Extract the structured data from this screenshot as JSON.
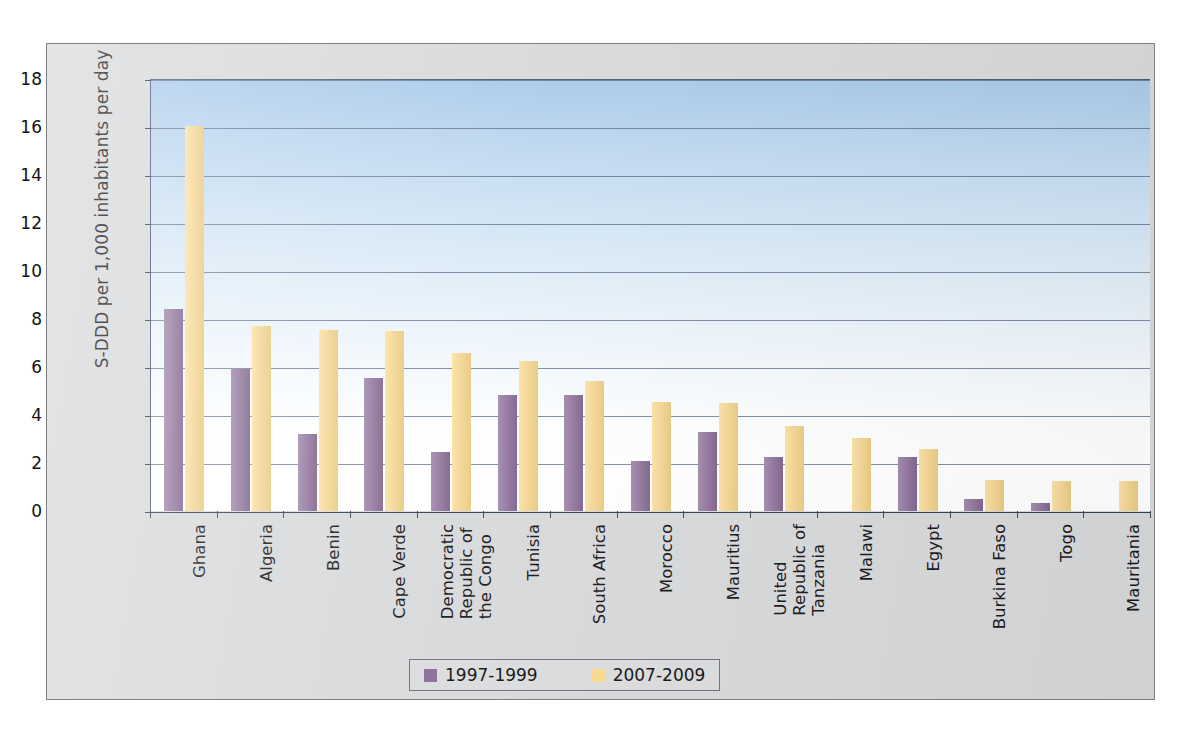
{
  "chart_data": {
    "type": "bar",
    "title": "",
    "subtitle": "",
    "xlabel": "",
    "ylabel": "S-DDD per 1,000 inhabitants per day",
    "ylim": [
      0,
      18
    ],
    "yticks": [
      0,
      2,
      4,
      6,
      8,
      10,
      12,
      14,
      16,
      18
    ],
    "ytick_labels": [
      "0",
      "2",
      "4",
      "6",
      "8",
      "10",
      "12",
      "14",
      "16",
      "18"
    ],
    "grid": true,
    "legend_position": "bottom",
    "categories": [
      "Ghana",
      "Algeria",
      "Benin",
      "Cape Verde",
      "Democratic\nRepublic of\nthe Congo",
      "Tunisia",
      "South Africa",
      "Morocco",
      "Mauritius",
      "United\nRepublic of\nTanzania",
      "Malawi",
      "Egypt",
      "Burkina Faso",
      "Togo",
      "Mauritania"
    ],
    "series": [
      {
        "name": "1997-1999",
        "color": "#8a6b98",
        "values": [
          8.4,
          5.9,
          3.2,
          5.55,
          2.45,
          4.85,
          4.85,
          2.1,
          3.3,
          2.25,
          null,
          2.25,
          0.5,
          0.35,
          null
        ]
      },
      {
        "name": "2007-2009",
        "color": "#fbd98c",
        "values": [
          16.05,
          7.7,
          7.55,
          7.5,
          6.6,
          6.25,
          5.4,
          4.55,
          4.5,
          3.55,
          3.05,
          2.6,
          1.3,
          1.25,
          1.25
        ]
      }
    ]
  },
  "legend": {
    "entries": [
      {
        "label": "1997-1999",
        "color": "#8a6b98"
      },
      {
        "label": "2007-2009",
        "color": "#fbd98c"
      }
    ]
  },
  "colors": {
    "series_1997": "#8a6b98",
    "series_2007": "#fbd98c",
    "plot_gradient_top": "#a9caea",
    "plot_gradient_bottom": "#ffffff",
    "frame_background": "#d8d9db",
    "gridline": "#5c6c86",
    "axis": "#33404f",
    "text": "#18181a"
  }
}
